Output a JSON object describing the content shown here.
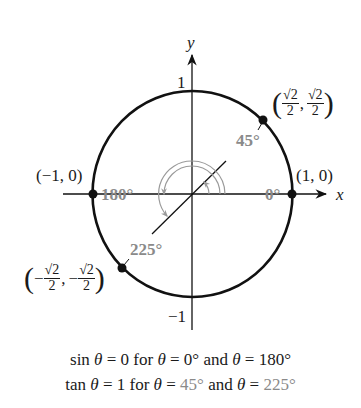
{
  "diagram": {
    "axes": {
      "x_label": "x",
      "y_label": "y"
    },
    "ticks": {
      "y_top": "1",
      "y_bottom": "−1"
    },
    "points": [
      {
        "id": "p0",
        "label": "(1, 0)",
        "angle": "0°"
      },
      {
        "id": "p180",
        "label": "(−1, 0)",
        "angle": "180°"
      },
      {
        "id": "p45",
        "label_num_x": "√2",
        "label_den_x": "2",
        "label_num_y": "√2",
        "label_den_y": "2",
        "sign_x": "",
        "sign_y": "",
        "angle": "45°"
      },
      {
        "id": "p225",
        "label_num_x": "√2",
        "label_den_x": "2",
        "label_num_y": "√2",
        "label_den_y": "2",
        "sign_x": "−",
        "sign_y": "−",
        "angle": "225°"
      }
    ],
    "colors": {
      "curve": "#111111",
      "angle_label": "#8a8a8a",
      "arc": "#9a9a9a"
    }
  },
  "captions": {
    "line1": {
      "func": "sin",
      "theta": "θ",
      "eq1": " = 0 for ",
      "eq2": " = ",
      "v1": "0°",
      "and": " and ",
      "v2": "180°"
    },
    "line2": {
      "func": "tan",
      "theta": "θ",
      "eq1": " = 1 for ",
      "eq2": " = ",
      "v1": "45°",
      "and": " and ",
      "v2": "225°"
    }
  }
}
